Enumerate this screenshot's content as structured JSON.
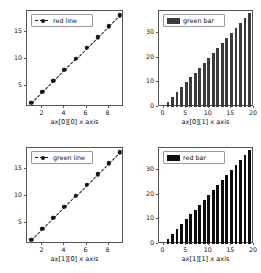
{
  "figure": {
    "rows": 2,
    "cols": 2,
    "background": "#ffffff",
    "foreground": "#111111"
  },
  "chart_data": [
    {
      "id": "ax00",
      "type": "line",
      "title": "",
      "xlabel": "ax[0][0] x axis",
      "ylabel": "",
      "legend": [
        {
          "name": "red line",
          "style": "dashed-marker",
          "color": "#151515"
        }
      ],
      "legend_position": "upper left",
      "grid": false,
      "linestyle": "dashed",
      "marker": "o",
      "color": "#151515",
      "x": [
        1,
        2,
        3,
        4,
        5,
        6,
        7,
        8,
        9
      ],
      "values": [
        2,
        4,
        6,
        8,
        10,
        12,
        14,
        16,
        18
      ],
      "xlim": [
        0.6,
        9.4
      ],
      "ylim": [
        1.2,
        18.8
      ],
      "xticks": [
        2,
        4,
        6,
        8
      ],
      "yticks": [
        5,
        10,
        15
      ]
    },
    {
      "id": "ax01",
      "type": "bar",
      "title": "",
      "xlabel": "ax[0][1] x axis",
      "ylabel": "",
      "legend": [
        {
          "name": "green bar",
          "style": "patch",
          "color": "#3b3b3b"
        }
      ],
      "legend_position": "upper left",
      "grid": false,
      "color": "#3b3b3b",
      "categories": [
        0,
        1,
        2,
        3,
        4,
        5,
        6,
        7,
        8,
        9,
        10,
        11,
        12,
        13,
        14,
        15,
        16,
        17,
        18,
        19
      ],
      "values": [
        0,
        2,
        4,
        6,
        8,
        10,
        12,
        14,
        16,
        18,
        20,
        22,
        24,
        26,
        28,
        30,
        32,
        34,
        36,
        38
      ],
      "xlim": [
        -1,
        20
      ],
      "ylim": [
        0,
        39
      ],
      "xticks": [
        0,
        5,
        10,
        15,
        20
      ],
      "yticks": [
        0,
        10,
        20,
        30
      ]
    },
    {
      "id": "ax10",
      "type": "line",
      "title": "",
      "xlabel": "ax[1][0] x axis",
      "ylabel": "",
      "legend": [
        {
          "name": "green line",
          "style": "dashed-marker",
          "color": "#151515"
        }
      ],
      "legend_position": "upper left",
      "grid": false,
      "linestyle": "dashed",
      "marker": "o",
      "color": "#151515",
      "x": [
        1,
        2,
        3,
        4,
        5,
        6,
        7,
        8,
        9
      ],
      "values": [
        2,
        4,
        6,
        8,
        10,
        12,
        14,
        16,
        18
      ],
      "xlim": [
        0.6,
        9.4
      ],
      "ylim": [
        1.2,
        18.8
      ],
      "xticks": [
        2,
        4,
        6,
        8
      ],
      "yticks": [
        5,
        10,
        15
      ]
    },
    {
      "id": "ax11",
      "type": "bar",
      "title": "",
      "xlabel": "ax[1][1] x axis",
      "ylabel": "",
      "legend": [
        {
          "name": "red bar",
          "style": "patch",
          "color": "#0d0d0d"
        }
      ],
      "legend_position": "upper left",
      "grid": false,
      "color": "#0d0d0d",
      "categories": [
        0,
        1,
        2,
        3,
        4,
        5,
        6,
        7,
        8,
        9,
        10,
        11,
        12,
        13,
        14,
        15,
        16,
        17,
        18,
        19
      ],
      "values": [
        0,
        2,
        4,
        6,
        8,
        10,
        12,
        14,
        16,
        18,
        20,
        22,
        24,
        26,
        28,
        30,
        32,
        34,
        36,
        38
      ],
      "xlim": [
        -1,
        20
      ],
      "ylim": [
        0,
        39
      ],
      "xticks": [
        0,
        5,
        10,
        15,
        20
      ],
      "yticks": [
        0,
        10,
        20,
        30
      ]
    }
  ]
}
